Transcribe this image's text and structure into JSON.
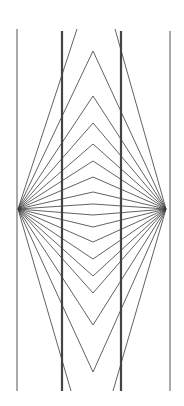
{
  "figure": {
    "title": "",
    "type": "Hering-style optical illusion",
    "colors": {
      "background": "#ffffff",
      "lines": "#3a3a3a",
      "verticals": "#444444"
    },
    "focal_points": {
      "left": [
        18,
        209
      ],
      "right": [
        166,
        209
      ]
    },
    "vertical_lines": [
      {
        "x": 17,
        "y1": 29,
        "y2": 391,
        "weight": "thin"
      },
      {
        "x": 62,
        "y1": 31,
        "y2": 391,
        "weight": "thick"
      },
      {
        "x": 121,
        "y1": 31,
        "y2": 391,
        "weight": "thick"
      },
      {
        "x": 170,
        "y1": 31,
        "y2": 391,
        "weight": "thin"
      }
    ],
    "apex_x": 93,
    "top_apexes_y": [
      51,
      96,
      123,
      144,
      161,
      177,
      192,
      204
    ],
    "bottom_apexes_y": [
      215,
      227,
      242,
      259,
      276,
      293,
      325,
      372
    ],
    "outer_rays": [
      {
        "from": "left",
        "to": [
          77,
          29
        ]
      },
      {
        "from": "left",
        "to": [
          71,
          391
        ]
      },
      {
        "from": "right",
        "to": [
          115,
          29
        ]
      },
      {
        "from": "right",
        "to": [
          113,
          391
        ]
      }
    ]
  }
}
